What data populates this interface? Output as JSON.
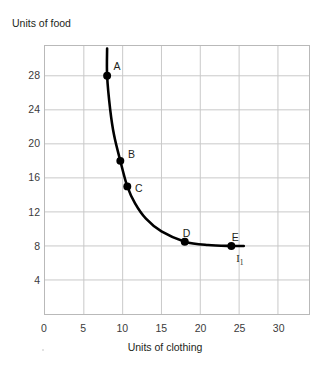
{
  "chart_data": {
    "type": "line",
    "title": "",
    "subtitle": "",
    "xlabel": "Units of clothing",
    "ylabel": "Units of food",
    "xlim": [
      0,
      34
    ],
    "ylim": [
      0,
      31.5
    ],
    "xticks": [
      0,
      5,
      10,
      15,
      20,
      25,
      30
    ],
    "xtick_labels": [
      "0",
      "5",
      "10",
      "15",
      "20",
      "25",
      "30"
    ],
    "yticks": [
      4,
      8,
      12,
      16,
      20,
      24,
      28
    ],
    "ytick_labels": [
      "4",
      "8",
      "12",
      "16",
      "20",
      "24",
      "28"
    ],
    "grid": true,
    "grid_color": "#c9c9c9",
    "frame_color": "#b9b9b9",
    "legend": "none",
    "curve_color": "#000000",
    "series": [
      {
        "name": "I1",
        "label": "I",
        "label_sub": "1",
        "curve_points": [
          [
            8.0,
            31.2
          ],
          [
            8.0,
            28.0
          ],
          [
            8.4,
            24.0
          ],
          [
            8.9,
            21.0
          ],
          [
            9.7,
            18.0
          ],
          [
            10.6,
            15.0
          ],
          [
            11.6,
            13.0
          ],
          [
            13.0,
            11.2
          ],
          [
            15.0,
            9.7
          ],
          [
            18.0,
            8.5
          ],
          [
            21.0,
            8.1
          ],
          [
            24.0,
            8.0
          ],
          [
            25.6,
            8.0
          ]
        ],
        "points": [
          {
            "label": "A",
            "x": 8.0,
            "y": 28.0
          },
          {
            "label": "B",
            "x": 9.7,
            "y": 18.0
          },
          {
            "label": "C",
            "x": 10.6,
            "y": 15.0
          },
          {
            "label": "D",
            "x": 18.0,
            "y": 8.5
          },
          {
            "label": "E",
            "x": 24.0,
            "y": 8.0
          }
        ]
      }
    ]
  },
  "axes": {
    "y_title": "Units of food",
    "x_title": "Units of clothing",
    "origin_label": "0"
  },
  "annotations": {
    "curve_label": "I",
    "curve_label_sub": "1"
  }
}
